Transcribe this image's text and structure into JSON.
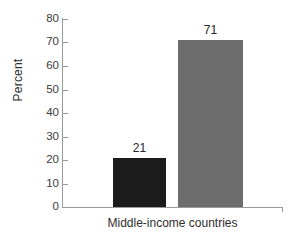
{
  "chart_data": {
    "type": "bar",
    "title": "",
    "subtitle": "",
    "xlabel": "Middle-income countries",
    "ylabel": "Percent",
    "categories": [
      "Middle-income countries"
    ],
    "ylim": [
      0,
      80
    ],
    "y_ticks": [
      0,
      10,
      20,
      30,
      40,
      50,
      60,
      70,
      80
    ],
    "y_tick_labels": [
      "0",
      "10",
      "20",
      "30",
      "40",
      "50",
      "60",
      "70",
      "80"
    ],
    "grid": false,
    "legend": "none",
    "bars": [
      {
        "name": "series-1",
        "value": 21,
        "label": "21",
        "color": "#1b1b1b"
      },
      {
        "name": "series-2",
        "value": 71,
        "label": "71",
        "color": "#6d6d6d"
      }
    ],
    "annotations": [
      "21",
      "71"
    ]
  },
  "axes": {
    "y_title": "Percent",
    "x_category": "Middle-income countries",
    "axis_color": "#9a9a9a"
  }
}
